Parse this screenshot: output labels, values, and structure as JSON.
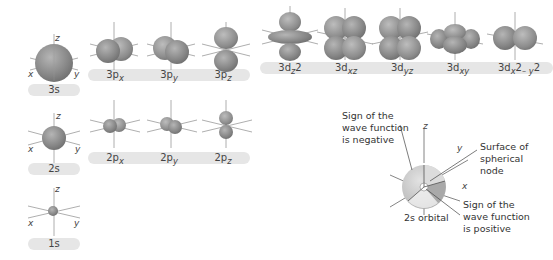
{
  "figure": {
    "rows": [
      {
        "shell": 3,
        "s": {
          "label": "3s",
          "axes": {
            "x": "x",
            "y": "y",
            "z": "z"
          }
        },
        "p": [
          {
            "label": "3p",
            "sub": "x"
          },
          {
            "label": "3p",
            "sub": "y"
          },
          {
            "label": "3p",
            "sub": "z"
          }
        ],
        "d": [
          {
            "label": "3d",
            "sub": "z",
            "sup": "2"
          },
          {
            "label": "3d",
            "sub": "xz"
          },
          {
            "label": "3d",
            "sub": "yz"
          },
          {
            "label": "3d",
            "sub": "xy"
          },
          {
            "label": "3d",
            "sub": "x",
            "sup": "2",
            "mid": "– y",
            "sup2": "2"
          }
        ]
      },
      {
        "shell": 2,
        "s": {
          "label": "2s",
          "axes": {
            "x": "x",
            "y": "y",
            "z": "z"
          }
        },
        "p": [
          {
            "label": "2p",
            "sub": "x"
          },
          {
            "label": "2p",
            "sub": "y"
          },
          {
            "label": "2p",
            "sub": "z"
          }
        ]
      },
      {
        "shell": 1,
        "s": {
          "label": "1s",
          "axes": {
            "x": "x",
            "y": "y",
            "z": "z"
          }
        }
      }
    ],
    "cutaway": {
      "caption": "2s orbital",
      "axes": {
        "x": "x",
        "y": "y",
        "z": "z"
      },
      "annotations": {
        "negative": [
          "Sign of the",
          "wave function",
          "is negative"
        ],
        "node": [
          "Surface of",
          "spherical",
          "node"
        ],
        "positive": [
          "Sign of the",
          "wave function",
          "is positive"
        ]
      }
    },
    "colors": {
      "orbital": "#8a8a8a",
      "orbital_light": "#c8c8c8",
      "label_bar": "#e6e6e6",
      "axis": "#999999"
    }
  }
}
